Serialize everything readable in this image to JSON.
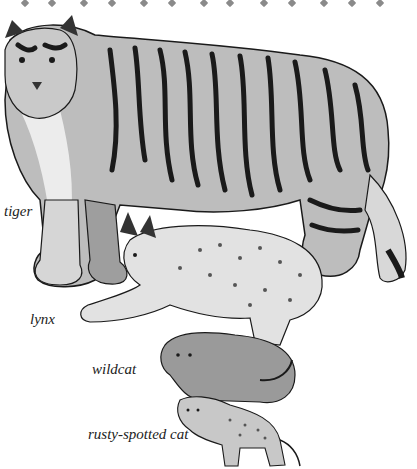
{
  "illustration": {
    "subject": "cat species size comparison",
    "labels": {
      "tiger": "tiger",
      "lynx": "lynx",
      "wildcat": "wildcat",
      "rusty_spotted_cat": "rusty-spotted cat"
    },
    "colors": {
      "background": "#ffffff",
      "ink": "#1a1a1a",
      "mid_gray": "#8a8a8a",
      "light_gray": "#cfcfcf",
      "label_text": "#222222"
    },
    "decoration": {
      "diamond_count": 13
    }
  }
}
